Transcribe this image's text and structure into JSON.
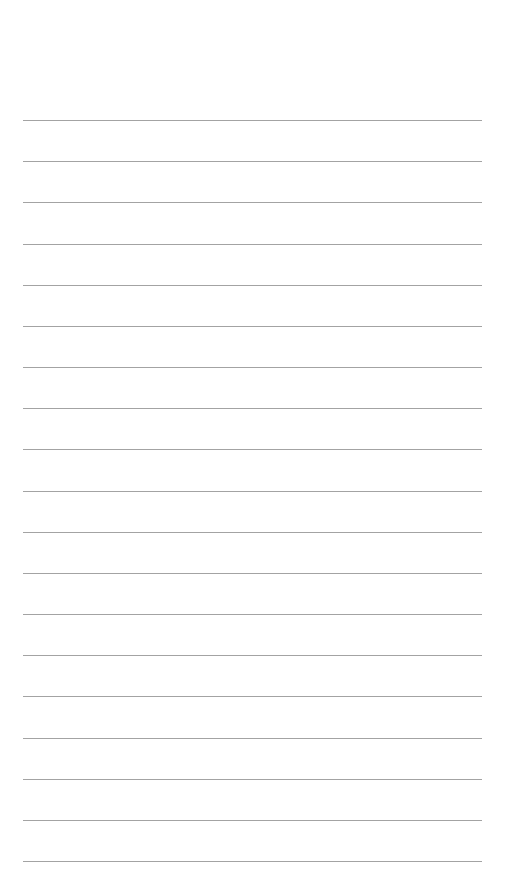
{
  "page": {
    "type": "ruled-blank-page",
    "background_color": "#ffffff",
    "rule_color": "#a3a3a3",
    "rule_count": 19,
    "rule_start_y": 120,
    "rule_spacing": 41.17,
    "rule_left": 23,
    "rule_width": 459,
    "text_content": ""
  }
}
